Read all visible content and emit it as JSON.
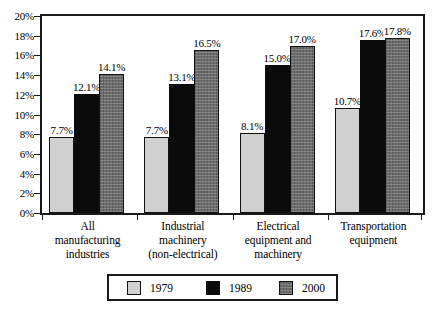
{
  "chart_data": {
    "type": "bar",
    "title": "",
    "subtitle": "",
    "xlabel": "",
    "ylabel": "",
    "ylim": [
      0,
      20
    ],
    "y_tick_step": 2,
    "y_tick_labels": [
      "0%",
      "2%",
      "4%",
      "6%",
      "8%",
      "10%",
      "12%",
      "14%",
      "16%",
      "18%",
      "20%"
    ],
    "grid": false,
    "legend_position": "bottom",
    "value_suffix": "%",
    "categories": [
      "All manufacturing industries",
      "Industrial machinery (non-electrical)",
      "Electrical equipment and machinery",
      "Transportation equipment"
    ],
    "category_lines": [
      [
        "All",
        "manufacturing",
        "industries"
      ],
      [
        "Industrial",
        "machinery",
        "(non-electrical)"
      ],
      [
        "Electrical",
        "equipment and",
        "machinery"
      ],
      [
        "Transportation",
        "equipment"
      ]
    ],
    "series": [
      {
        "name": "1979",
        "color": "#d0d0d0",
        "values": [
          7.7,
          7.7,
          8.1,
          10.7
        ],
        "labels": [
          "7.7%",
          "7.7%",
          "8.1%",
          "10.7%"
        ]
      },
      {
        "name": "1989",
        "color": "#0b0b0b",
        "values": [
          12.1,
          13.1,
          15.0,
          17.6
        ],
        "labels": [
          "12.1%",
          "13.1%",
          "15.0%",
          "17.6%"
        ]
      },
      {
        "name": "2000",
        "color": "#6e6e6e",
        "values": [
          14.1,
          16.5,
          17.0,
          17.8
        ],
        "labels": [
          "14.1%",
          "16.5%",
          "17.0%",
          "17.8%"
        ]
      }
    ]
  },
  "legend": {
    "entries": [
      {
        "label": "1979"
      },
      {
        "label": "1989"
      },
      {
        "label": "2000"
      }
    ]
  }
}
